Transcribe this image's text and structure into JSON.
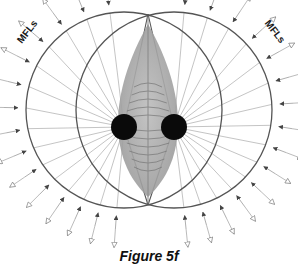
{
  "figure": {
    "caption": "Figure 5f",
    "labels": {
      "left": "MFLs",
      "right": "MFLs"
    },
    "colors": {
      "circle_stroke": "#555555",
      "ray_stroke": "#b5b5b5",
      "arrow_fill": "#444444",
      "hollow_arrow_stroke": "#777777",
      "dot_fill": "#0a0a0a",
      "lens_fill": "#a8a8a8",
      "lens_stripe": "#6e6e6e"
    },
    "geometry": {
      "dot_left": {
        "cx": 124,
        "cy": 127,
        "r": 13
      },
      "dot_right": {
        "cx": 174,
        "cy": 127,
        "r": 13
      },
      "circle_left": {
        "cx": 124,
        "cy": 110,
        "r": 98
      },
      "circle_right": {
        "cx": 174,
        "cy": 110,
        "r": 98
      },
      "inner_lens_top": [
        148,
        14
      ],
      "inner_lens_bottom": [
        148,
        205
      ]
    }
  }
}
